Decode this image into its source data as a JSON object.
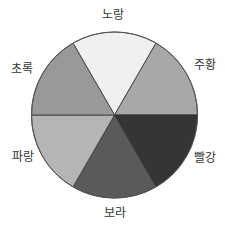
{
  "chart_data": {
    "type": "pie",
    "title": "",
    "categories": [
      "노랑",
      "주황",
      "빨강",
      "보라",
      "파랑",
      "초록"
    ],
    "values": [
      1,
      1,
      1,
      1,
      1,
      1
    ],
    "percentages": [
      16.67,
      16.67,
      16.67,
      16.67,
      16.67,
      16.67
    ],
    "colors": [
      "#f0f0f0",
      "#a8a8a8",
      "#353535",
      "#5a5a5a",
      "#b5b5b5",
      "#999999"
    ],
    "start_angle_deg": -30,
    "direction": "clockwise",
    "legend": "none (labels outside slices)",
    "center": [
      114.5,
      115
    ],
    "radius": 83,
    "label_positions": [
      [
        113,
        15
      ],
      [
        205,
        65
      ],
      [
        205,
        158
      ],
      [
        115,
        213
      ],
      [
        23,
        157
      ],
      [
        22,
        69
      ]
    ]
  }
}
